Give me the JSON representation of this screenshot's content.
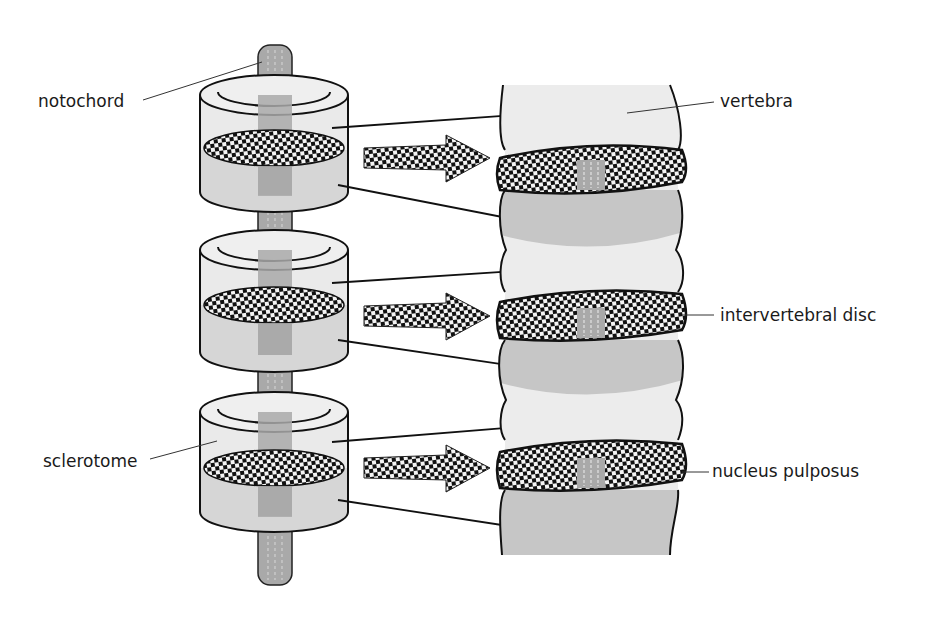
{
  "diagram": {
    "type": "anatomical-illustration",
    "labels": {
      "notochord": "notochord",
      "vertebra": "vertebra",
      "intervertebral_disc": "intervertebral disc",
      "sclerotome": "sclerotome",
      "nucleus_pulposus": "nucleus pulposus"
    },
    "left_structure": {
      "name": "sclerotome segments around notochord",
      "segment_count": 3
    },
    "right_structure": {
      "name": "vertebral column",
      "disc_count": 3
    },
    "transform_arrows": 3,
    "colors": {
      "light_tissue": "#ececec",
      "dark_tissue": "#c4c4c4",
      "notochord": "#a9a9a9",
      "outline": "#111111",
      "text": "#1a1a1a"
    }
  }
}
